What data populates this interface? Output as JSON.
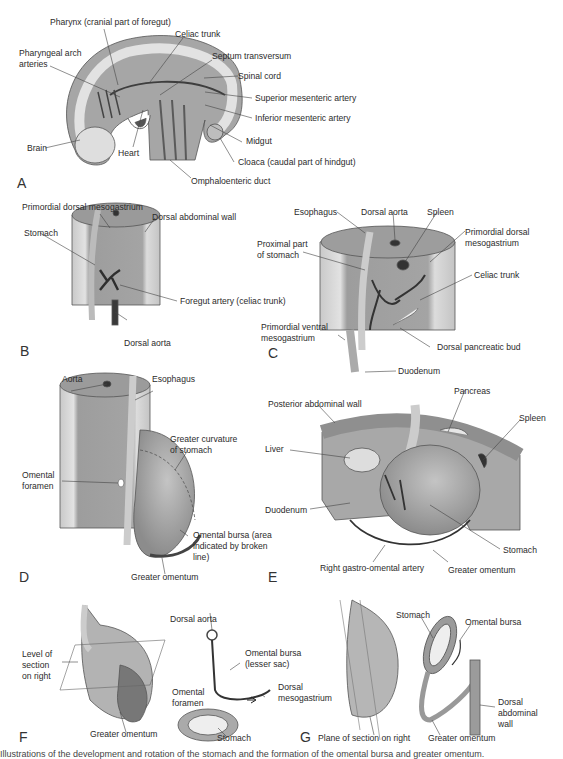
{
  "figure": {
    "panels": {
      "A": {
        "letter": "A",
        "labels": {
          "pharynx": "Pharynx (cranial part of foregut)",
          "celiac_trunk": "Celiac trunk",
          "pharyngeal_arch_1": "Pharyngeal arch",
          "pharyngeal_arch_2": "arteries",
          "septum_transversum": "Septum transversum",
          "spinal_cord": "Spinal cord",
          "superior_mesenteric": "Superior mesenteric artery",
          "inferior_mesenteric": "Inferior mesenteric artery",
          "midgut": "Midgut",
          "brain": "Brain",
          "heart": "Heart",
          "cloaca": "Cloaca (caudal part of hindgut)",
          "omphaloenteric": "Omphaloenteric duct"
        }
      },
      "B": {
        "letter": "B",
        "labels": {
          "primordial_dorsal_mesogastrium": "Primordial dorsal mesogastrium",
          "dorsal_abdominal_wall": "Dorsal abdominal wall",
          "stomach": "Stomach",
          "foregut_artery": "Foregut artery (celiac trunk)",
          "dorsal_aorta": "Dorsal aorta"
        }
      },
      "C": {
        "letter": "C",
        "labels": {
          "esophagus": "Esophagus",
          "dorsal_aorta": "Dorsal aorta",
          "spleen": "Spleen",
          "proximal_1": "Proximal part",
          "proximal_2": "of stomach",
          "pdm_1": "Primordial dorsal",
          "pdm_2": "mesogastrium",
          "celiac_trunk": "Celiac trunk",
          "pvm_1": "Primordial ventral",
          "pvm_2": "mesogastrium",
          "dorsal_pancreatic_bud": "Dorsal pancreatic bud",
          "duodenum": "Duodenum"
        }
      },
      "D": {
        "letter": "D",
        "labels": {
          "aorta": "Aorta",
          "esophagus": "Esophagus",
          "greater_curvature_1": "Greater curvature",
          "greater_curvature_2": "of stomach",
          "omental_foramen_1": "Omental",
          "omental_foramen_2": "foramen",
          "omental_bursa_1": "Omental bursa (area",
          "omental_bursa_2": "indicated by broken",
          "omental_bursa_3": "line)",
          "greater_omentum": "Greater omentum"
        }
      },
      "E": {
        "letter": "E",
        "labels": {
          "posterior_wall": "Posterior abdominal wall",
          "pancreas": "Pancreas",
          "spleen": "Spleen",
          "liver": "Liver",
          "duodenum": "Duodenum",
          "stomach": "Stomach",
          "right_gastro_omental": "Right gastro-omental artery",
          "greater_omentum": "Greater omentum"
        }
      },
      "F": {
        "letter": "F",
        "labels": {
          "level_1": "Level of",
          "level_2": "section",
          "level_3": "on right",
          "greater_omentum": "Greater omentum",
          "dorsal_aorta": "Dorsal aorta",
          "omental_bursa_1": "Omental bursa",
          "omental_bursa_2": "(lesser sac)",
          "omental_foramen_1": "Omental",
          "omental_foramen_2": "foramen",
          "dorsal_meso_1": "Dorsal",
          "dorsal_meso_2": "mesogastrium",
          "stomach": "Stomach"
        }
      },
      "G": {
        "letter": "G",
        "labels": {
          "stomach": "Stomach",
          "omental_bursa": "Omental bursa",
          "dorsal_wall_1": "Dorsal",
          "dorsal_wall_2": "abdominal",
          "dorsal_wall_3": "wall",
          "plane": "Plane of section on right",
          "greater_omentum": "Greater omentum"
        }
      }
    },
    "caption": "Illustrations of the development and rotation of the stomach and the formation of the omental bursa and greater omentum.",
    "colors": {
      "outline": "#4a4a4a",
      "tissue_light": "#d9d9d9",
      "tissue_mid": "#a8a8a8",
      "tissue_dark": "#777777",
      "vessel": "#3a3a3a",
      "background": "#ffffff"
    }
  }
}
